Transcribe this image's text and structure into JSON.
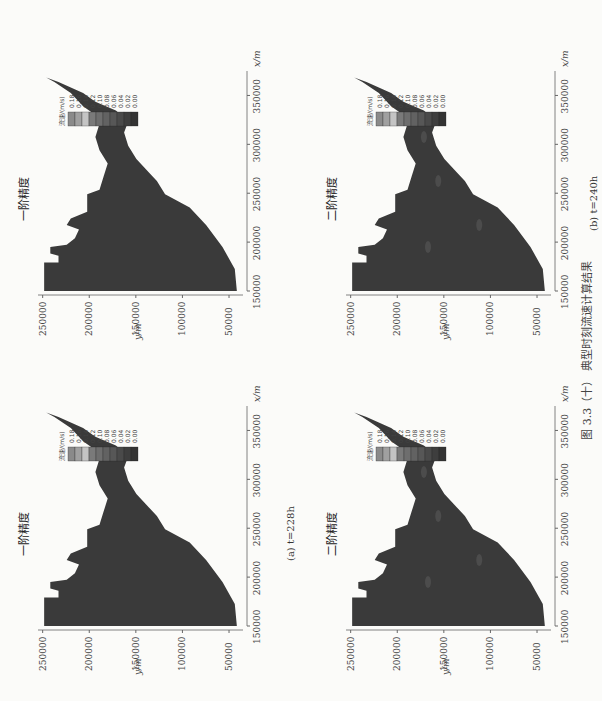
{
  "figure_caption": "图 3.3（十）  典型时刻流速计算结果",
  "subcaptions": [
    "(a) t=228h",
    "(b) t=240h"
  ],
  "chart_data": [
    {
      "type": "heatmap",
      "title": "一阶精度",
      "time": "t=228h",
      "xlabel": "x/m",
      "ylabel": "y/m",
      "xticks": [
        150000,
        200000,
        250000,
        300000,
        350000
      ],
      "yticks": [
        50000,
        100000,
        150000,
        200000,
        250000
      ],
      "xlim": [
        150000,
        375000
      ],
      "ylim": [
        35000,
        255000
      ],
      "legend": {
        "title": "流速/(m/s)",
        "values": [
          0.18,
          0.16,
          0.14,
          0.12,
          0.1,
          0.08,
          0.06,
          0.04,
          0.02,
          0.0
        ],
        "placement": "top-right"
      }
    },
    {
      "type": "heatmap",
      "title": "二阶精度",
      "time": "t=228h",
      "xlabel": "x/m",
      "ylabel": "y/m",
      "xticks": [
        150000,
        200000,
        250000,
        300000,
        350000
      ],
      "yticks": [
        50000,
        100000,
        150000,
        200000,
        250000
      ],
      "xlim": [
        150000,
        375000
      ],
      "ylim": [
        35000,
        255000
      ],
      "legend": {
        "title": "流速/(m/s)",
        "values": [
          0.18,
          0.16,
          0.14,
          0.12,
          0.1,
          0.08,
          0.06,
          0.04,
          0.02,
          0.0
        ],
        "placement": "top-right"
      }
    },
    {
      "type": "heatmap",
      "title": "一阶精度",
      "time": "t=240h",
      "xlabel": "x/m",
      "ylabel": "y/m",
      "xticks": [
        150000,
        200000,
        250000,
        300000,
        350000
      ],
      "yticks": [
        50000,
        100000,
        150000,
        200000,
        250000
      ],
      "xlim": [
        150000,
        375000
      ],
      "ylim": [
        35000,
        255000
      ],
      "legend": {
        "title": "流速/(m/s)",
        "values": [
          0.18,
          0.16,
          0.14,
          0.12,
          0.1,
          0.08,
          0.06,
          0.04,
          0.02,
          0.0
        ],
        "placement": "top-right"
      }
    },
    {
      "type": "heatmap",
      "title": "二阶精度",
      "time": "t=240h",
      "xlabel": "x/m",
      "ylabel": "y/m",
      "xticks": [
        150000,
        200000,
        250000,
        300000,
        350000
      ],
      "yticks": [
        50000,
        100000,
        150000,
        200000,
        250000
      ],
      "xlim": [
        150000,
        375000
      ],
      "ylim": [
        35000,
        255000
      ],
      "legend": {
        "title": "流速/(m/s)",
        "values": [
          0.18,
          0.16,
          0.14,
          0.12,
          0.1,
          0.08,
          0.06,
          0.04,
          0.02,
          0.0
        ],
        "placement": "top-right"
      }
    }
  ],
  "legend_colors": [
    "#8a8a8a",
    "#a0a0a0",
    "#c4c4c4",
    "#7a7a7a",
    "#6e6e6e",
    "#626262",
    "#575757",
    "#4a4a4a",
    "#3e3e3e",
    "#333333"
  ]
}
